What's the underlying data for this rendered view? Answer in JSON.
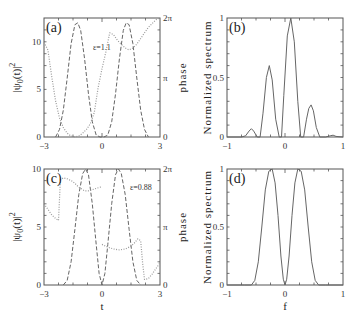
{
  "chart_data": [
    {
      "id": "a",
      "type": "line",
      "panel_label": "(a)",
      "annotation": "ε=1.1",
      "xlabel": "",
      "ylabel": "|ψ0(t)|²",
      "y2label": "phase",
      "xlim": [
        -3,
        3
      ],
      "ylim": [
        0,
        12.5
      ],
      "y2lim": [
        0,
        6.2832
      ],
      "xticks": [
        "-3",
        "0",
        "3"
      ],
      "yticks": [
        {
          "v": 0,
          "label": "0"
        },
        {
          "v": 5,
          "label": "5"
        },
        {
          "v": 10,
          "label": "10"
        }
      ],
      "y2ticks": [
        {
          "v": 0,
          "label": "0"
        },
        {
          "v": 3.1416,
          "label": "π"
        },
        {
          "v": 6.2832,
          "label": "2π"
        }
      ],
      "series": [
        {
          "name": "intensity",
          "style": "dashed",
          "axis": "left",
          "x": [
            -2.4,
            -2.2,
            -2.0,
            -1.8,
            -1.6,
            -1.4,
            -1.25,
            -1.1,
            -0.9,
            -0.7,
            -0.5,
            -0.3,
            -0.1,
            0.1,
            0.3,
            0.5,
            0.7,
            0.9,
            1.1,
            1.25,
            1.4,
            1.6,
            1.8,
            2.0,
            2.2,
            2.4
          ],
          "y": [
            0,
            0.8,
            2.8,
            6.2,
            9.8,
            11.8,
            12.0,
            11.2,
            8.2,
            4.5,
            1.6,
            0.2,
            0,
            0,
            0.2,
            1.6,
            4.5,
            8.2,
            11.2,
            12.0,
            11.8,
            9.8,
            6.2,
            2.8,
            0.8,
            0
          ]
        },
        {
          "name": "phase",
          "style": "dotted",
          "axis": "right",
          "x": [
            -3.0,
            -2.8,
            -2.6,
            -2.4,
            -2.2,
            -2.0,
            -1.8,
            -1.6,
            -1.4,
            -1.2,
            -1.0,
            -0.8,
            -0.6,
            -0.4,
            -0.2,
            0.0,
            0.2,
            0.4,
            0.6,
            0.8,
            1.0,
            1.2,
            1.4,
            1.6,
            1.8,
            2.0,
            2.2,
            2.4,
            2.6,
            2.8,
            3.0
          ],
          "y": [
            5.0,
            4.6,
            3.2,
            1.9,
            1.0,
            0.5,
            0.2,
            0.05,
            0.0,
            0.05,
            0.2,
            0.4,
            0.7,
            1.3,
            2.6,
            3.6,
            4.5,
            5.5,
            5.4,
            5.1,
            4.9,
            4.7,
            4.6,
            4.7,
            4.9,
            5.2,
            5.5,
            5.8,
            6.0,
            6.2,
            6.28
          ]
        }
      ]
    },
    {
      "id": "b",
      "type": "line",
      "panel_label": "(b)",
      "xlabel": "",
      "ylabel": "Normalized spectrum",
      "xlim": [
        -1,
        1
      ],
      "ylim": [
        0,
        1
      ],
      "xticks": [
        "-1",
        "0",
        "1"
      ],
      "yticks": [
        {
          "v": 0,
          "label": "0"
        },
        {
          "v": 0.5,
          "label": "0.5"
        },
        {
          "v": 1,
          "label": "1"
        }
      ],
      "series": [
        {
          "name": "spectrum",
          "style": "solid",
          "x": [
            -1.0,
            -0.75,
            -0.68,
            -0.62,
            -0.58,
            -0.54,
            -0.48,
            -0.43,
            -0.38,
            -0.32,
            -0.27,
            -0.22,
            -0.16,
            -0.1,
            -0.06,
            -0.02,
            0.04,
            0.1,
            0.16,
            0.22,
            0.27,
            0.32,
            0.37,
            0.41,
            0.45,
            0.49,
            0.54,
            0.6,
            0.7,
            0.78,
            0.83,
            0.88,
            1.0
          ],
          "y": [
            0,
            0,
            0.01,
            0.05,
            0.07,
            0.05,
            0.0,
            0.0,
            0.2,
            0.5,
            0.6,
            0.48,
            0.15,
            0.0,
            0.0,
            0.35,
            0.85,
            1.0,
            0.8,
            0.3,
            0.0,
            0.0,
            0.15,
            0.24,
            0.27,
            0.22,
            0.08,
            0.0,
            0.0,
            0.01,
            0.015,
            0.005,
            0
          ]
        }
      ]
    },
    {
      "id": "c",
      "type": "line",
      "panel_label": "(c)",
      "annotation": "ε=0.88",
      "xlabel": "t",
      "ylabel": "|ψ0(t)|²",
      "y2label": "phase",
      "xlim": [
        -3,
        3
      ],
      "ylim": [
        0,
        10
      ],
      "y2lim": [
        0,
        6.2832
      ],
      "xticks": [
        "-3",
        "0",
        "3"
      ],
      "yticks": [
        {
          "v": 0,
          "label": "0"
        },
        {
          "v": 5,
          "label": "5"
        },
        {
          "v": 10,
          "label": "10"
        }
      ],
      "y2ticks": [
        {
          "v": 0,
          "label": "0"
        },
        {
          "v": 3.1416,
          "label": "π"
        },
        {
          "v": 6.2832,
          "label": "2π"
        }
      ],
      "series": [
        {
          "name": "intensity",
          "style": "dashed",
          "axis": "left",
          "x": [
            -2.0,
            -1.8,
            -1.6,
            -1.4,
            -1.2,
            -1.0,
            -0.85,
            -0.7,
            -0.5,
            -0.3,
            -0.15,
            0.0,
            0.15,
            0.3,
            0.5,
            0.7,
            0.85,
            1.0,
            1.2,
            1.4,
            1.6,
            1.8,
            2.0
          ],
          "y": [
            0,
            0.4,
            2.0,
            4.8,
            7.8,
            9.6,
            10.0,
            9.5,
            7.0,
            3.5,
            1.0,
            0,
            1.0,
            3.5,
            7.0,
            9.5,
            10.0,
            9.6,
            7.8,
            4.8,
            2.0,
            0.4,
            0
          ]
        },
        {
          "name": "phase-left",
          "style": "dotted",
          "axis": "right",
          "x": [
            -3.0,
            -2.8,
            -2.6,
            -2.4,
            -2.25,
            -2.15,
            -2.0,
            -1.8,
            -1.5,
            -1.2,
            -0.9,
            -0.7,
            -0.4,
            -0.1,
            0.0
          ],
          "y": [
            4.4,
            4.1,
            3.8,
            3.6,
            3.5,
            5.7,
            5.8,
            5.75,
            5.6,
            5.3,
            5.1,
            5.1,
            5.2,
            5.3,
            5.35
          ]
        },
        {
          "name": "phase-right",
          "style": "dotted",
          "axis": "right",
          "x": [
            0.0,
            0.3,
            0.6,
            0.9,
            1.2,
            1.5,
            1.7,
            1.85,
            2.0,
            2.1,
            2.2,
            2.4,
            2.6,
            2.8,
            3.0
          ],
          "y": [
            2.2,
            2.05,
            1.95,
            1.9,
            1.95,
            2.1,
            2.3,
            2.5,
            2.4,
            1.2,
            0.3,
            0.35,
            0.6,
            0.9,
            1.2
          ]
        }
      ]
    },
    {
      "id": "d",
      "type": "line",
      "panel_label": "(d)",
      "xlabel": "f",
      "ylabel": "Normalized spectrum",
      "xlim": [
        -1,
        1
      ],
      "ylim": [
        0,
        1
      ],
      "xticks": [
        "-1",
        "0",
        "1"
      ],
      "yticks": [
        {
          "v": 0,
          "label": "0"
        },
        {
          "v": 0.5,
          "label": "0.5"
        },
        {
          "v": 1,
          "label": "1"
        }
      ],
      "series": [
        {
          "name": "spectrum",
          "style": "solid",
          "x": [
            -1.0,
            -0.7,
            -0.58,
            -0.52,
            -0.46,
            -0.4,
            -0.34,
            -0.28,
            -0.22,
            -0.17,
            -0.12,
            -0.07,
            -0.03,
            0.0,
            0.03,
            0.07,
            0.12,
            0.17,
            0.22,
            0.28,
            0.34,
            0.4,
            0.46,
            0.52,
            0.58,
            0.7,
            1.0
          ],
          "y": [
            0,
            0,
            0.0,
            0.04,
            0.2,
            0.5,
            0.82,
            0.98,
            1.0,
            0.88,
            0.6,
            0.25,
            0.05,
            0.0,
            0.05,
            0.25,
            0.6,
            0.88,
            1.0,
            0.98,
            0.82,
            0.5,
            0.2,
            0.04,
            0.0,
            0,
            0
          ]
        }
      ]
    }
  ],
  "layout": {
    "panels": [
      {
        "id": "a",
        "x0": 44,
        "y0": 18,
        "x1": 160,
        "y1": 137,
        "annot_pos": [
          93,
          50
        ]
      },
      {
        "id": "b",
        "x0": 227,
        "y0": 18,
        "x1": 343,
        "y1": 137
      },
      {
        "id": "c",
        "x0": 44,
        "y0": 169,
        "x1": 160,
        "y1": 285,
        "annot_pos": [
          130,
          190
        ]
      },
      {
        "id": "d",
        "x0": 227,
        "y0": 169,
        "x1": 343,
        "y1": 285
      }
    ]
  },
  "colors": {
    "frame": "#555555",
    "curve": "#666666",
    "dotted": "#999999"
  }
}
